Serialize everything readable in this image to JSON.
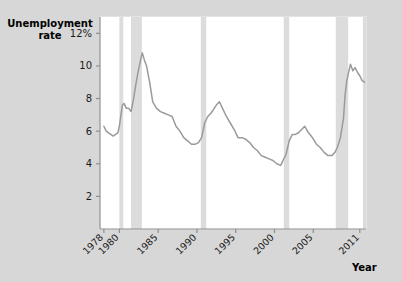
{
  "chart_data": {
    "type": "line",
    "title": "",
    "ylabel_line1": "Unemployment",
    "ylabel_line2": "rate",
    "xlabel": "Year",
    "ylim": [
      0,
      13
    ],
    "xlim": [
      1977.5,
      2011.8
    ],
    "grid": false,
    "legend": "none",
    "y_ticks": [
      {
        "value": 2,
        "label": "2"
      },
      {
        "value": 4,
        "label": "4"
      },
      {
        "value": 6,
        "label": "6"
      },
      {
        "value": 8,
        "label": "8"
      },
      {
        "value": 10,
        "label": "10"
      },
      {
        "value": 12,
        "label": "12%"
      }
    ],
    "x_ticks": [
      {
        "value": 1978,
        "label": "1978"
      },
      {
        "value": 1980,
        "label": "1980"
      },
      {
        "value": 1985,
        "label": "1985"
      },
      {
        "value": 1990,
        "label": "1990"
      },
      {
        "value": 1995,
        "label": "1995"
      },
      {
        "value": 2000,
        "label": "2000"
      },
      {
        "value": 2005,
        "label": "2005"
      },
      {
        "value": 2011,
        "label": "2011"
      }
    ],
    "recession_bands": [
      {
        "name": "recession-1980",
        "start": 1980.0,
        "end": 1980.5
      },
      {
        "name": "recession-1981-1982",
        "start": 1981.5,
        "end": 1982.9
      },
      {
        "name": "recession-1990-1991",
        "start": 1990.5,
        "end": 1991.2
      },
      {
        "name": "recession-2001",
        "start": 2001.2,
        "end": 2001.9
      },
      {
        "name": "recession-2007-2009",
        "start": 2007.9,
        "end": 2009.5
      },
      {
        "name": "recession-2011-edge",
        "start": 2011.4,
        "end": 2011.8
      }
    ],
    "series": [
      {
        "name": "Unemployment rate",
        "color": "#9a9a9a",
        "x": [
          1978.0,
          1978.3,
          1978.6,
          1978.9,
          1979.2,
          1979.5,
          1979.8,
          1980.0,
          1980.2,
          1980.4,
          1980.6,
          1980.9,
          1981.2,
          1981.5,
          1981.8,
          1982.1,
          1982.4,
          1982.7,
          1982.95,
          1983.2,
          1983.5,
          1983.9,
          1984.3,
          1984.8,
          1985.3,
          1985.8,
          1986.3,
          1986.8,
          1987.3,
          1987.8,
          1988.3,
          1988.8,
          1989.3,
          1989.8,
          1990.2,
          1990.6,
          1991.0,
          1991.4,
          1991.8,
          1992.1,
          1992.5,
          1992.9,
          1993.3,
          1993.8,
          1994.3,
          1994.8,
          1995.3,
          1995.8,
          1996.3,
          1996.8,
          1997.3,
          1997.8,
          1998.3,
          1998.8,
          1999.3,
          1999.8,
          2000.3,
          2000.8,
          2001.1,
          2001.5,
          2001.9,
          2002.3,
          2002.7,
          2003.1,
          2003.5,
          2003.9,
          2004.4,
          2004.9,
          2005.4,
          2005.9,
          2006.4,
          2006.9,
          2007.4,
          2007.8,
          2008.1,
          2008.5,
          2008.9,
          2009.1,
          2009.3,
          2009.5,
          2009.8,
          2010.1,
          2010.4,
          2010.7,
          2011.0,
          2011.3,
          2011.6
        ],
        "y": [
          6.3,
          6.0,
          5.9,
          5.8,
          5.7,
          5.8,
          5.9,
          6.3,
          7.0,
          7.6,
          7.7,
          7.4,
          7.4,
          7.2,
          7.9,
          8.8,
          9.6,
          10.3,
          10.8,
          10.4,
          10.0,
          9.0,
          7.8,
          7.4,
          7.2,
          7.1,
          7.0,
          6.9,
          6.3,
          6.0,
          5.6,
          5.4,
          5.2,
          5.2,
          5.3,
          5.6,
          6.5,
          6.9,
          7.1,
          7.3,
          7.6,
          7.8,
          7.4,
          6.9,
          6.5,
          6.1,
          5.6,
          5.6,
          5.5,
          5.3,
          5.0,
          4.8,
          4.5,
          4.4,
          4.3,
          4.2,
          4.0,
          3.9,
          4.2,
          4.6,
          5.4,
          5.8,
          5.8,
          5.9,
          6.1,
          6.3,
          5.9,
          5.6,
          5.2,
          5.0,
          4.7,
          4.5,
          4.5,
          4.7,
          5.0,
          5.6,
          6.8,
          8.2,
          9.0,
          9.5,
          10.1,
          9.7,
          9.9,
          9.6,
          9.4,
          9.1,
          9.0
        ]
      }
    ]
  }
}
